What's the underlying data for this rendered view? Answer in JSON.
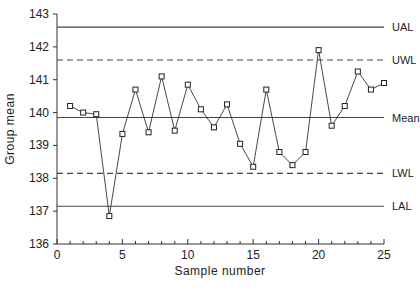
{
  "chart_data": {
    "type": "line",
    "title": "",
    "xlabel": "Sample number",
    "ylabel": "Group mean",
    "xlim": [
      0,
      25
    ],
    "ylim": [
      136,
      143
    ],
    "x_ticks": [
      0,
      5,
      10,
      15,
      20,
      25
    ],
    "y_ticks": [
      136,
      137,
      138,
      139,
      140,
      141,
      142,
      143
    ],
    "grid": false,
    "series": [
      {
        "name": "Group mean",
        "marker": "square",
        "x": [
          1,
          2,
          3,
          4,
          5,
          6,
          7,
          8,
          9,
          10,
          11,
          12,
          13,
          14,
          15,
          16,
          17,
          18,
          19,
          20,
          21,
          22,
          23,
          24,
          25
        ],
        "values": [
          140.2,
          140.0,
          139.95,
          136.85,
          139.35,
          140.7,
          139.4,
          141.1,
          139.45,
          140.85,
          140.1,
          139.55,
          140.25,
          139.05,
          138.35,
          140.7,
          138.8,
          138.4,
          138.8,
          141.9,
          139.6,
          140.2,
          141.25,
          140.7,
          140.9
        ]
      }
    ],
    "reference_lines": [
      {
        "label": "UAL",
        "value": 142.6,
        "style": "solid"
      },
      {
        "label": "UWL",
        "value": 141.6,
        "style": "dashed"
      },
      {
        "label": "Mean",
        "value": 139.85,
        "style": "solid"
      },
      {
        "label": "LWL",
        "value": 138.15,
        "style": "dashed"
      },
      {
        "label": "LAL",
        "value": 137.15,
        "style": "solid"
      }
    ]
  }
}
